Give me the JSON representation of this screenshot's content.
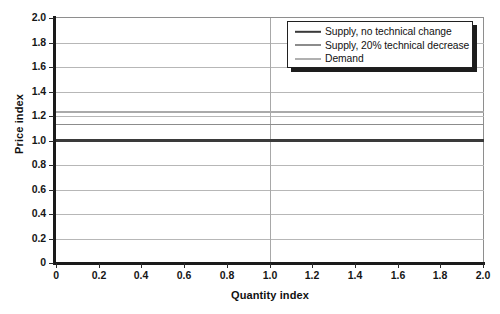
{
  "chart_data": {
    "type": "line",
    "title": "",
    "xlabel": "Quantity index",
    "ylabel": "Price index",
    "xlim": [
      0,
      2.0
    ],
    "ylim": [
      0,
      2.0
    ],
    "grid": true,
    "legend_position": "top-right",
    "xticks": [
      "0",
      "0.2",
      "0.4",
      "0.6",
      "0.8",
      "1.0",
      "1.2",
      "1.4",
      "1.6",
      "1.8",
      "2.0"
    ],
    "xtick_values": [
      0,
      0.2,
      0.4,
      0.6,
      0.8,
      1.0,
      1.2,
      1.4,
      1.6,
      1.8,
      2.0
    ],
    "yticks": [
      "0",
      "0.2",
      "0.4",
      "0.6",
      "0.8",
      "1.0",
      "1.2",
      "1.4",
      "1.6",
      "1.8",
      "2.0"
    ],
    "ytick_values": [
      0,
      0.2,
      0.4,
      0.6,
      0.8,
      1.0,
      1.2,
      1.4,
      1.6,
      1.8,
      2.0
    ],
    "vertical_reference_line": 1.0,
    "x": [
      0,
      2.0
    ],
    "series": [
      {
        "name": "Supply, no technical change",
        "values": [
          1.0,
          1.0
        ],
        "color": "#3a3a3a",
        "width": 2.2
      },
      {
        "name": "Supply, 20% technical decrease",
        "values": [
          1.13,
          1.13
        ],
        "color": "#8c8c8c",
        "width": 1.8
      },
      {
        "name": "Demand",
        "values": [
          1.23,
          1.23
        ],
        "color": "#aaaaaa",
        "width": 1.8
      }
    ]
  },
  "legend": {
    "items": [
      {
        "label": "Supply, no technical change",
        "color": "#3a3a3a",
        "width": 2.4
      },
      {
        "label": "Supply, 20% technical decrease",
        "color": "#8c8c8c",
        "width": 2.0
      },
      {
        "label": "Demand",
        "color": "#b0b0b0",
        "width": 2.0
      }
    ]
  },
  "axes": {
    "x_title": "Quantity index",
    "y_title": "Price index"
  }
}
